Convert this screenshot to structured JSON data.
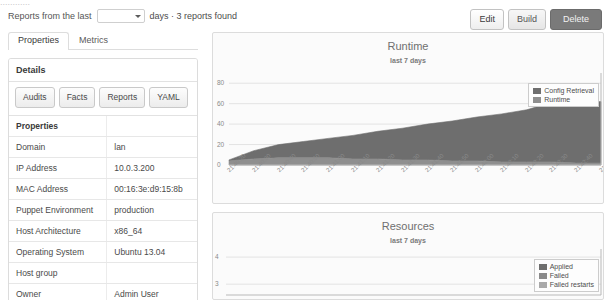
{
  "top_cut_text": "............",
  "filter": {
    "prefix_label": "Reports from the last",
    "select_value": "",
    "suffix_label": "days · 3 reports found",
    "caret_icon": "chevron-down-icon"
  },
  "actions": {
    "edit_label": "Edit",
    "build_label": "Build",
    "delete_label": "Delete"
  },
  "tabs": [
    {
      "label": "Properties",
      "active": true
    },
    {
      "label": "Metrics",
      "active": false
    }
  ],
  "details": {
    "heading": "Details",
    "buttons": [
      "Audits",
      "Facts",
      "Reports",
      "YAML"
    ],
    "table": {
      "header": [
        "Properties",
        ""
      ],
      "rows": [
        {
          "key": "Domain",
          "value": "lan"
        },
        {
          "key": "IP Address",
          "value": "10.0.3.200"
        },
        {
          "key": "MAC Address",
          "value": "00:16:3e:d9:15:8b"
        },
        {
          "key": "Puppet Environment",
          "value": "production"
        },
        {
          "key": "Host Architecture",
          "value": "x86_64"
        },
        {
          "key": "Operating System",
          "value": "Ubuntu 13.04"
        },
        {
          "key": "Host group",
          "value": ""
        },
        {
          "key": "Owner",
          "value": "Admin User"
        }
      ]
    }
  },
  "colors": {
    "series_dark": "#6e6e6e",
    "series_mid": "#8a8a8a",
    "series_light": "#a9a9a9",
    "grid": "#e3e3e3",
    "axis": "#b9b9b9",
    "plot_bg": "#fbfbfb"
  },
  "chart_data": [
    {
      "type": "area",
      "name": "runtime-chart",
      "title": "Runtime",
      "subtitle": "last 7 days",
      "xlabel": "",
      "ylabel": "",
      "ylim": [
        0,
        90
      ],
      "yticks": [
        0,
        20,
        40,
        60,
        80
      ],
      "grid": true,
      "legend_position": "top-right",
      "stacked": true,
      "x": [
        "21:40:20",
        "21:40:30",
        "21:40:40",
        "21:40:50",
        "21:41:00",
        "21:41:10",
        "21:41:20",
        "21:41:30",
        "21:41:40",
        "21:41:50",
        "21:42:00",
        "21:42:10",
        "21:42:20",
        "21:42:30",
        "21:42:40",
        "21:42:50"
      ],
      "series": [
        {
          "name": "Runtime",
          "color": "#8f8f8f",
          "values": [
            4,
            6,
            7,
            7,
            7,
            6,
            6,
            5,
            5,
            4,
            4,
            3,
            3,
            3,
            2,
            2
          ]
        },
        {
          "name": "Config Retrieval",
          "color": "#6e6e6e",
          "values": [
            1,
            8,
            13,
            16,
            19,
            23,
            27,
            31,
            35,
            39,
            43,
            47,
            51,
            58,
            59,
            60
          ]
        }
      ]
    },
    {
      "type": "area",
      "name": "resources-chart",
      "title": "Resources",
      "subtitle": "last 7 days",
      "xlabel": "",
      "ylabel": "",
      "ylim": [
        2.6,
        4.3
      ],
      "yticks": [
        3,
        4
      ],
      "grid": true,
      "legend_position": "right",
      "stacked": true,
      "x": [
        "21:40:20",
        "21:40:40",
        "21:41:00",
        "21:41:20",
        "21:41:40",
        "21:42:00",
        "21:42:20",
        "21:42:40"
      ],
      "series": [
        {
          "name": "Applied",
          "color": "#6e6e6e",
          "values": [
            0,
            0,
            0,
            0,
            0,
            0,
            0,
            0
          ]
        },
        {
          "name": "Failed",
          "color": "#8a8a8a",
          "values": [
            0,
            0,
            0,
            0,
            0,
            0,
            0,
            0
          ]
        },
        {
          "name": "Failed restarts",
          "color": "#a9a9a9",
          "values": [
            0,
            0,
            0,
            0,
            0,
            0,
            0,
            0
          ]
        }
      ]
    }
  ]
}
